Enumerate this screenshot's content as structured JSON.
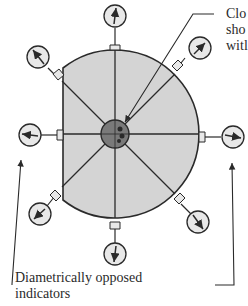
{
  "diagram": {
    "labels": {
      "top_line1": "Clo",
      "top_line2": "sho",
      "top_line3": "witl",
      "bottom_line1": "Diametrically opposed",
      "bottom_line2": "indicators"
    },
    "colors": {
      "part_fill": "#d4d4d4",
      "center_fill": "#7a7a7a",
      "stroke": "#2a2a2a",
      "gauge_fill": "#e8e8e8"
    },
    "indicators": [
      {
        "name": "top",
        "angle_deg": 270
      },
      {
        "name": "top-right",
        "angle_deg": 315
      },
      {
        "name": "right",
        "angle_deg": 0
      },
      {
        "name": "bottom-right",
        "angle_deg": 45
      },
      {
        "name": "bottom",
        "angle_deg": 90
      },
      {
        "name": "bottom-left",
        "angle_deg": 135
      },
      {
        "name": "left",
        "angle_deg": 180
      },
      {
        "name": "top-left",
        "angle_deg": 225
      }
    ]
  }
}
